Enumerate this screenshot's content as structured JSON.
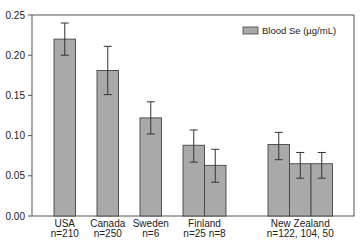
{
  "chart_data": {
    "type": "bar",
    "title": "",
    "xlabel": "",
    "ylabel": "",
    "ylim": [
      0,
      0.25
    ],
    "yticks": [
      "0.00",
      "0.05",
      "0.10",
      "0.15",
      "0.20",
      "0.25"
    ],
    "ytick_values": [
      0,
      0.05,
      0.1,
      0.15,
      0.2,
      0.25
    ],
    "grid": false,
    "legend": {
      "position": "top-right",
      "entries": [
        "Blood Se (µg/mL)"
      ]
    },
    "bar_color": "#a9a9a9",
    "groups": [
      {
        "name": "USA",
        "n_label": "n=210",
        "values": [
          0.22
        ],
        "err_low": [
          0.2
        ],
        "err_high": [
          0.24
        ]
      },
      {
        "name": "Canada",
        "n_label": "n=250",
        "values": [
          0.181
        ],
        "err_low": [
          0.151
        ],
        "err_high": [
          0.211
        ]
      },
      {
        "name": "Sweden",
        "n_label": "n=6",
        "values": [
          0.122
        ],
        "err_low": [
          0.102
        ],
        "err_high": [
          0.142
        ]
      },
      {
        "name": "Finland",
        "n_label": "n=25 n=8",
        "values": [
          0.088,
          0.063
        ],
        "err_low": [
          0.067,
          0.042
        ],
        "err_high": [
          0.107,
          0.083
        ]
      },
      {
        "name": "New Zealand",
        "n_label": "n=122, 104, 50",
        "values": [
          0.089,
          0.065,
          0.065
        ],
        "err_low": [
          0.07,
          0.047,
          0.047
        ],
        "err_high": [
          0.104,
          0.079,
          0.079
        ]
      }
    ]
  }
}
